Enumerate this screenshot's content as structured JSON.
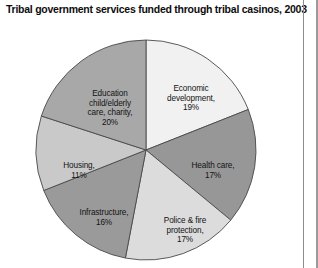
{
  "chart_data": {
    "type": "pie",
    "title": "Tribal government services funded through tribal casinos, 2003",
    "xlabel": "",
    "ylabel": "",
    "legend": "none",
    "grid": false,
    "start_angle_deg": 0,
    "direction": "clockwise",
    "units": "percent",
    "total": 100,
    "categories": [
      "Economic development",
      "Health care",
      "Police & fire protection",
      "Infrastructure",
      "Housing",
      "Education child/elderly care, charity"
    ],
    "values": [
      19,
      17,
      17,
      16,
      11,
      20
    ],
    "slices": [
      {
        "name": "economic-development",
        "label": "Economic\ndevelopment,\n19%",
        "category": "Economic development",
        "value": 19,
        "value_text": "19%",
        "color": "#f1f1f1",
        "start_deg": 0,
        "end_deg": 68.4
      },
      {
        "name": "health-care",
        "label": "Health care,\n17%",
        "category": "Health care",
        "value": 17,
        "value_text": "17%",
        "color": "#979797",
        "start_deg": 68.4,
        "end_deg": 129.6
      },
      {
        "name": "police-fire-protection",
        "label": "Police & fire\nprotection,\n17%",
        "category": "Police & fire protection",
        "value": 17,
        "value_text": "17%",
        "color": "#dcdcdc",
        "start_deg": 129.6,
        "end_deg": 190.8
      },
      {
        "name": "infrastructure",
        "label": "Infrastructure,\n16%",
        "category": "Infrastructure",
        "value": 16,
        "value_text": "16%",
        "color": "#9a9a9a",
        "start_deg": 190.8,
        "end_deg": 248.4
      },
      {
        "name": "housing",
        "label": "Housing,\n11%",
        "category": "Housing",
        "value": 11,
        "value_text": "11%",
        "color": "#c9c9c9",
        "start_deg": 248.4,
        "end_deg": 288.0
      },
      {
        "name": "education-child-elderly-care-charity",
        "label": "Education\nchild/elderly\ncare, charity,\n20%",
        "category": "Education child/elderly care, charity",
        "value": 20,
        "value_text": "20%",
        "color": "#a8a8a8",
        "start_deg": 288.0,
        "end_deg": 360.0
      }
    ]
  }
}
